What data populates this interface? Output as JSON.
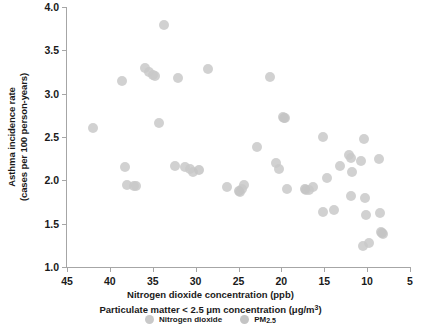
{
  "chart_data": {
    "type": "scatter",
    "title": "",
    "xlabel": "Nitrogen dioxide concentration (ppb)",
    "xlabel2_pre": "Particulate matter < 2.5 ",
    "xlabel2_mu": "μm",
    "xlabel2_mid": " concentration (",
    "xlabel2_mu2": "μg/m",
    "xlabel2_sup": "3",
    "xlabel2_post": ")",
    "ylabel_line1": "Asthma incidence rate",
    "ylabel_line2": "(cases per 100 person-years)",
    "xlim": [
      45,
      5
    ],
    "ylim": [
      1.0,
      4.0
    ],
    "x_reversed": true,
    "grid": false,
    "xticks": [
      45,
      40,
      35,
      30,
      25,
      20,
      15,
      10,
      5
    ],
    "yticks": [
      "1.0",
      "1.5",
      "2.0",
      "2.5",
      "3.0",
      "3.5",
      "4.0"
    ],
    "ytick_values": [
      1.0,
      1.5,
      2.0,
      2.5,
      3.0,
      3.5,
      4.0
    ],
    "legend_position": "bottom",
    "marker_color_no2": "#c9c9c9",
    "marker_color_pm": "#c4c4c4",
    "axis_color": "#a6a6a6",
    "series": [
      {
        "name": "Nitrogen dioxide",
        "key": "no2",
        "points": [
          [
            42.0,
            2.6
          ],
          [
            38.6,
            3.15
          ],
          [
            38.2,
            2.15
          ],
          [
            38.0,
            1.95
          ],
          [
            37.2,
            1.94
          ],
          [
            36.9,
            1.93
          ],
          [
            35.9,
            3.3
          ],
          [
            35.4,
            3.25
          ],
          [
            35.0,
            3.21
          ],
          [
            34.7,
            3.2
          ],
          [
            33.7,
            3.79
          ],
          [
            34.3,
            2.66
          ],
          [
            32.4,
            2.17
          ],
          [
            32.0,
            3.18
          ],
          [
            31.2,
            2.15
          ],
          [
            30.6,
            2.13
          ],
          [
            30.3,
            2.1
          ],
          [
            28.6,
            3.29
          ],
          [
            26.3,
            1.92
          ],
          [
            24.8,
            1.87
          ],
          [
            24.6,
            1.9
          ],
          [
            24.4,
            1.95
          ],
          [
            22.9,
            2.39
          ],
          [
            21.3,
            3.19
          ],
          [
            20.6,
            2.2
          ],
          [
            20.3,
            2.13
          ],
          [
            19.8,
            2.73
          ],
          [
            19.6,
            2.72
          ],
          [
            19.4,
            1.9
          ],
          [
            17.1,
            1.89
          ],
          [
            16.8,
            1.89
          ],
          [
            16.3,
            1.92
          ],
          [
            15.1,
            2.5
          ],
          [
            15.2,
            1.64
          ],
          [
            14.7,
            2.03
          ],
          [
            13.9,
            1.66
          ],
          [
            13.2,
            2.17
          ],
          [
            12.1,
            2.29
          ],
          [
            11.9,
            2.26
          ],
          [
            11.8,
            2.1
          ],
          [
            11.9,
            1.82
          ],
          [
            10.4,
            2.48
          ],
          [
            10.7,
            2.22
          ],
          [
            10.3,
            1.8
          ],
          [
            10.1,
            1.6
          ],
          [
            10.5,
            1.24
          ],
          [
            9.8,
            1.28
          ],
          [
            8.6,
            2.25
          ],
          [
            8.5,
            1.62
          ],
          [
            8.4,
            1.4
          ],
          [
            8.2,
            1.38
          ]
        ]
      },
      {
        "name": "PM2.5",
        "key": "pm",
        "label_pre": "PM",
        "label_sub": "2.5",
        "points": [
          [
            29.6,
            2.12
          ],
          [
            24.9,
            1.88
          ],
          [
            19.7,
            2.72
          ],
          [
            17.2,
            1.9
          ],
          [
            8.3,
            1.39
          ]
        ]
      }
    ]
  },
  "legend": {
    "items": [
      {
        "label": "Nitrogen dioxide",
        "key": "no2"
      },
      {
        "label": "PM",
        "sub": "2.5",
        "key": "pm"
      }
    ]
  }
}
